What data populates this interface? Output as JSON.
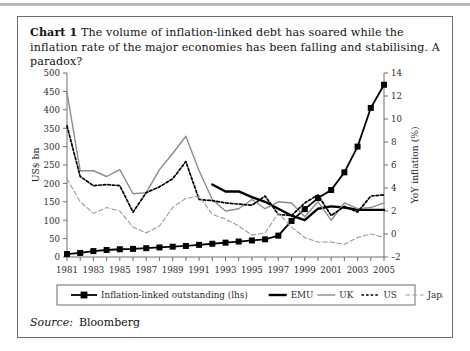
{
  "figure": {
    "label": "Chart 1",
    "caption": "The volume of inflation-linked debt has soared while the inflation rate of the major economies has been falling and stabilising. A paradox?",
    "source_label": "Source:",
    "source_value": "Bloomberg"
  },
  "colors": {
    "series_outstanding": "#000000",
    "series_emu": "#000000",
    "series_uk": "#8c8c8c",
    "series_us": "#000000",
    "series_japan": "#9a9a9a",
    "axis": "#6e6e6e",
    "frame": "#6e6e6e",
    "text": "#2b2b2b"
  },
  "chart_data": {
    "type": "line",
    "title": "",
    "xlabel": "",
    "ylabel": "US$ bn",
    "y2label": "YoY inflation (%)",
    "grid": false,
    "legend_position": "bottom",
    "x": [
      1981,
      1982,
      1983,
      1984,
      1985,
      1986,
      1987,
      1988,
      1989,
      1990,
      1991,
      1992,
      1993,
      1994,
      1995,
      1996,
      1997,
      1998,
      1999,
      2000,
      2001,
      2002,
      2003,
      2004,
      2005
    ],
    "xticklabels": [
      "1981",
      "1983",
      "1985",
      "1987",
      "1989",
      "1991",
      "1993",
      "1995",
      "1997",
      "1999",
      "2001",
      "2003",
      "2005"
    ],
    "xlim": [
      1981,
      2005
    ],
    "ylim": [
      0,
      500
    ],
    "yticks": [
      0,
      50,
      100,
      150,
      200,
      250,
      300,
      350,
      400,
      450,
      500
    ],
    "y2lim": [
      -2,
      14
    ],
    "y2ticks": [
      -2,
      0,
      2,
      4,
      6,
      8,
      10,
      12,
      14
    ],
    "series": [
      {
        "name": "Inflation-linked outstanding (lhs)",
        "axis": "left",
        "style": "solid-marker",
        "marker": "square",
        "values": [
          8,
          11,
          16,
          19,
          21,
          22,
          24,
          26,
          28,
          30,
          33,
          36,
          39,
          42,
          45,
          48,
          58,
          98,
          130,
          160,
          182,
          230,
          300,
          405,
          468
        ]
      },
      {
        "name": "EMU",
        "axis": "right",
        "style": "thick-solid",
        "values": [
          null,
          null,
          null,
          null,
          null,
          null,
          null,
          null,
          null,
          null,
          null,
          4.3,
          3.7,
          3.7,
          3.2,
          2.8,
          2.2,
          1.6,
          1.2,
          2.2,
          2.4,
          2.3,
          2.1,
          2.1,
          2.1
        ]
      },
      {
        "name": "UK",
        "axis": "right",
        "style": "solid-grey",
        "values": [
          12.3,
          5.5,
          5.5,
          5.0,
          5.6,
          3.5,
          3.6,
          5.6,
          7.0,
          8.5,
          5.5,
          3.0,
          2.0,
          2.2,
          3.0,
          2.2,
          2.8,
          2.7,
          1.5,
          2.8,
          1.2,
          2.7,
          2.2,
          2.3,
          2.7
        ]
      },
      {
        "name": "US",
        "axis": "right",
        "style": "dotted",
        "values": [
          9.4,
          5.0,
          4.2,
          4.3,
          4.2,
          1.9,
          3.6,
          4.1,
          4.8,
          6.3,
          3.0,
          2.9,
          2.7,
          2.6,
          2.5,
          3.3,
          1.7,
          1.6,
          2.7,
          3.4,
          1.6,
          2.4,
          1.9,
          3.3,
          3.4
        ]
      },
      {
        "name": "Japan",
        "axis": "right",
        "style": "dashed",
        "values": [
          4.8,
          2.8,
          1.8,
          2.3,
          2.0,
          0.6,
          0.1,
          0.7,
          2.3,
          3.1,
          3.3,
          1.7,
          1.3,
          0.7,
          -0.1,
          0.1,
          1.8,
          0.6,
          -0.3,
          -0.7,
          -0.7,
          -0.9,
          -0.3,
          0.0,
          -0.3
        ]
      }
    ]
  },
  "legend": {
    "items": [
      {
        "label": "Inflation-linked outstanding (lhs)",
        "style": "solid-marker"
      },
      {
        "label": "EMU",
        "style": "thick-solid"
      },
      {
        "label": "UK",
        "style": "solid-grey"
      },
      {
        "label": "US",
        "style": "dotted"
      },
      {
        "label": "Japan",
        "style": "dashed"
      }
    ]
  }
}
